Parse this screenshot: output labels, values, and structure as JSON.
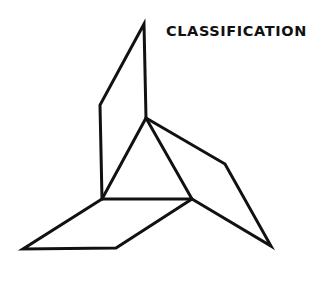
{
  "title": "CLASSIFICATION",
  "figure": {
    "stroke_color": "#111111",
    "background": "#ffffff"
  }
}
